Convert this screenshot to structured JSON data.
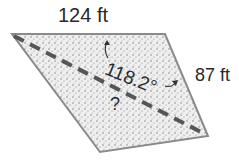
{
  "diagram": {
    "shape": "parallelogram",
    "side_top": "124 ft",
    "side_right": "87 ft",
    "angle": "118.2°",
    "unknown": "?",
    "diagonal": "dashed",
    "colors": {
      "fill": "#dcdcdc",
      "edge": "#8a8a8a",
      "dash": "#555555",
      "text": "#2a2a2a"
    }
  }
}
